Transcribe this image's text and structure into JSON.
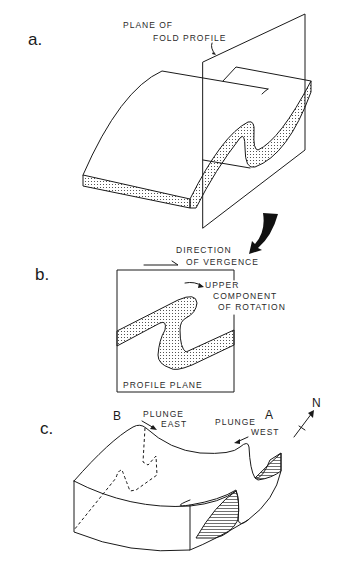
{
  "figure": {
    "panels": [
      {
        "id": "a",
        "label": "a.",
        "annotations": {
          "plane_line1": "PLANE OF",
          "plane_line2": "FOLD PROFILE"
        }
      },
      {
        "id": "b",
        "label": "b.",
        "annotations": {
          "vergence_line1": "DIRECTION",
          "vergence_line2": "OF VERGENCE",
          "upper_line1": "UPPER",
          "upper_line2": "COMPONENT",
          "upper_line3": "OF ROTATION",
          "profile": "PROFILE PLANE"
        }
      },
      {
        "id": "c",
        "label": "c.",
        "annotations": {
          "point_b": "B",
          "point_a": "A",
          "plunge_east_1": "PLUNGE",
          "plunge_east_2": "EAST",
          "plunge_west_1": "PLUNGE",
          "plunge_west_2": "WEST",
          "north": "N"
        }
      }
    ],
    "colors": {
      "line": "#1a1a1a",
      "background": "#ffffff"
    }
  }
}
